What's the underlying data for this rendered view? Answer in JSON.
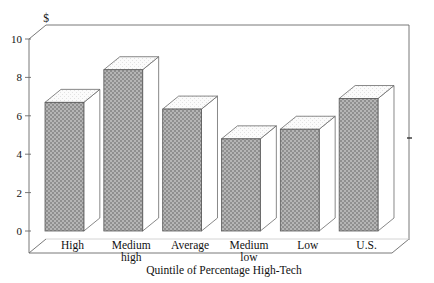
{
  "chart_data": {
    "type": "bar",
    "title": "",
    "subtitle": "",
    "xlabel": "Quintile of Percentage High-Tech",
    "ylabel": "$",
    "unit_symbol": "$",
    "categories": [
      "High",
      "Medium high",
      "Average",
      "Medium low",
      "Low",
      "U.S."
    ],
    "category_lines": [
      [
        "High"
      ],
      [
        "Medium",
        "high"
      ],
      [
        "Average"
      ],
      [
        "Medium",
        "low"
      ],
      [
        "Low"
      ],
      [
        "U.S."
      ]
    ],
    "values": [
      6.7,
      8.4,
      6.35,
      4.8,
      5.3,
      6.9
    ],
    "ylim": [
      0,
      10
    ],
    "yticks": [
      0,
      2,
      4,
      6,
      8,
      10
    ],
    "ytick_labels": [
      "0",
      "2",
      "4",
      "6",
      "8",
      "10"
    ],
    "grid": false,
    "legend": "none",
    "style": "3d-bar",
    "bar_fill_color": "#a0a0a0",
    "bar_edge_color": "#4a4a4a",
    "axis_color": "#555555",
    "background_color": "#ffffff"
  },
  "axes": {
    "y_unit_label": "$",
    "x_axis_title": "Quintile of Percentage High-Tech"
  }
}
